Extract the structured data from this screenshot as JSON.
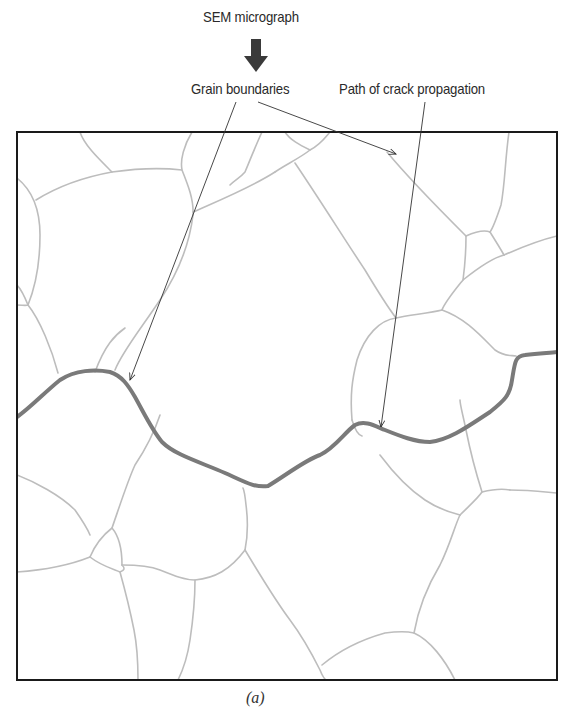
{
  "figure": {
    "title": "SEM micrograph",
    "caption": "(a)",
    "annotations": {
      "grain_boundaries": "Grain boundaries",
      "crack_path": "Path of crack propagation"
    }
  },
  "colors": {
    "grain_boundary": "#b9b9b9",
    "crack_path": "#7a7a7a",
    "frame": "#1a1a1a",
    "leader_line": "#333333",
    "down_arrow": "#3a3a3a"
  },
  "elements": {
    "down_arrow_icon": "down-arrow",
    "frame": "micrograph-frame"
  }
}
